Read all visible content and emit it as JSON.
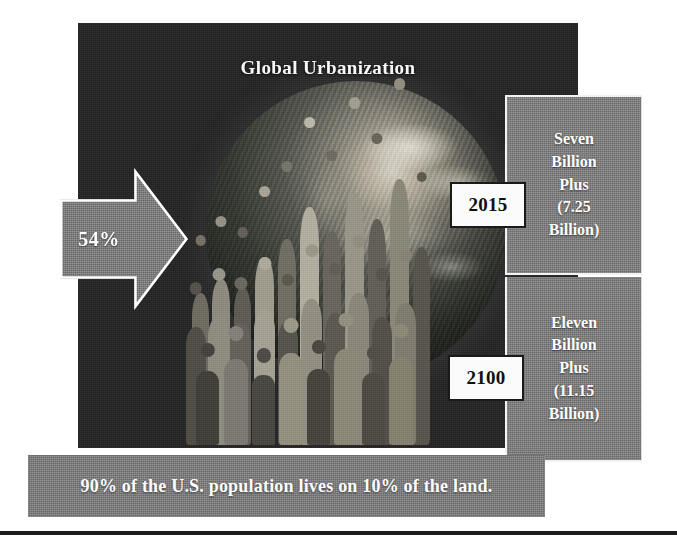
{
  "title": "Global Urbanization",
  "arrow": {
    "name": "urban-share-arrow",
    "label": "54%",
    "direction": "right",
    "fill_color": "#7e7e7e",
    "outline_color": "#ffffff",
    "text_color": "#ffffff"
  },
  "panels": [
    {
      "id": "year-2015",
      "year": "2015",
      "text": "Seven\nBillion\nPlus\n(7.25\nBillion)",
      "lines": [
        "Seven",
        "Billion",
        "Plus",
        "(7.25",
        "Billion)"
      ],
      "population_billions": 7.25,
      "panel_color": "#7f7f7f",
      "text_color": "#ffffff"
    },
    {
      "id": "year-2100",
      "year": "2100",
      "text": "Eleven\nBillion\nPlus\n(11.15\nBillion)",
      "lines": [
        "Eleven",
        "Billion",
        "Plus",
        "(11.15",
        "Billion)"
      ],
      "population_billions": 11.15,
      "panel_color": "#7f7f7f",
      "text_color": "#ffffff"
    }
  ],
  "caption": "90% of the U.S. population lives on 10% of the land.",
  "imagery": {
    "globe_alt": "earth-globe-photo",
    "crowd_alt": "crowd-of-people-photo",
    "background_color": "#232323"
  },
  "colors": {
    "background": "#ffffff",
    "dark_panel": "#232323",
    "gray_panel": "#7f7f7f",
    "white_text": "#ffffff",
    "black_text": "#101010",
    "rule": "#1c1c1c"
  }
}
